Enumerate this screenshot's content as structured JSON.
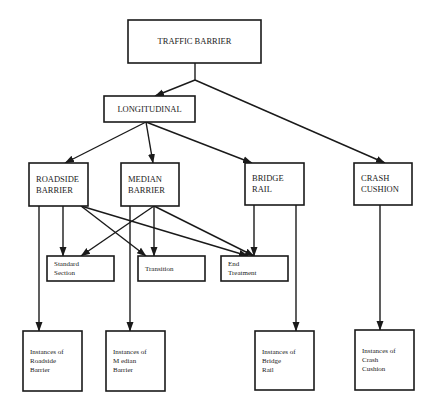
{
  "diagram": {
    "title": "TRAFFIC BARRIER",
    "nodes": [
      {
        "id": "traffic_barrier",
        "lines": [
          "TRAFFIC BARRIER"
        ],
        "x": 128,
        "y": 20,
        "w": 133,
        "h": 43,
        "font_size": 8.5,
        "align": "center"
      },
      {
        "id": "longitudinal",
        "lines": [
          "LONGITUDINAL"
        ],
        "x": 104,
        "y": 96,
        "w": 91,
        "h": 26,
        "font_size": 8.5,
        "align": "center"
      },
      {
        "id": "roadside_barrier",
        "lines": [
          "ROADSIDE",
          "BARRIER"
        ],
        "x": 29,
        "y": 163,
        "w": 59,
        "h": 43,
        "font_size": 8.5,
        "align": "left"
      },
      {
        "id": "median_barrier",
        "lines": [
          "MEDIAN",
          "BARRIER"
        ],
        "x": 121,
        "y": 163,
        "w": 58,
        "h": 43,
        "font_size": 8.5,
        "align": "left"
      },
      {
        "id": "bridge_rail",
        "lines": [
          "BRIDGE",
          "RAIL"
        ],
        "x": 245,
        "y": 163,
        "w": 59,
        "h": 42,
        "font_size": 8.5,
        "align": "left"
      },
      {
        "id": "crash_cushion",
        "lines": [
          "CRASH",
          "CUSHION"
        ],
        "x": 354,
        "y": 163,
        "w": 58,
        "h": 42,
        "font_size": 8.5,
        "align": "left"
      },
      {
        "id": "standard_section",
        "lines": [
          "Standard",
          "Section"
        ],
        "x": 47,
        "y": 256,
        "w": 67,
        "h": 25,
        "font_size": 7,
        "align": "left"
      },
      {
        "id": "transition",
        "lines": [
          "Transition"
        ],
        "x": 138,
        "y": 256,
        "w": 67,
        "h": 25,
        "font_size": 7,
        "align": "left"
      },
      {
        "id": "end_treatment",
        "lines": [
          "End",
          "Treatment"
        ],
        "x": 221,
        "y": 256,
        "w": 67,
        "h": 25,
        "font_size": 7,
        "align": "left"
      },
      {
        "id": "instances_roadside",
        "lines": [
          "Instances of",
          "Roadside",
          "Barrier"
        ],
        "x": 23,
        "y": 331,
        "w": 59,
        "h": 60,
        "font_size": 7,
        "align": "left"
      },
      {
        "id": "instances_median",
        "lines": [
          "Instances of",
          "M edian",
          "Barrier"
        ],
        "x": 106,
        "y": 331,
        "w": 59,
        "h": 60,
        "font_size": 7,
        "align": "left"
      },
      {
        "id": "instances_bridge",
        "lines": [
          "Instances of",
          "Bridge",
          "Rail"
        ],
        "x": 255,
        "y": 331,
        "w": 59,
        "h": 59,
        "font_size": 7,
        "align": "left"
      },
      {
        "id": "instances_crash",
        "lines": [
          "Instances of",
          "Crash",
          "Cushion"
        ],
        "x": 355,
        "y": 330,
        "w": 59,
        "h": 60,
        "font_size": 7,
        "align": "left"
      }
    ],
    "edges": [
      {
        "from": "traffic_barrier",
        "to": "junction",
        "points": [
          [
            195,
            63
          ],
          [
            195,
            80
          ]
        ],
        "arrow": false
      },
      {
        "from": "junction",
        "to": "longitudinal",
        "points": [
          [
            195,
            80
          ],
          [
            155,
            96
          ]
        ],
        "arrow": true
      },
      {
        "from": "junction",
        "to": "crash_cushion",
        "points": [
          [
            195,
            80
          ],
          [
            385,
            163
          ]
        ],
        "arrow": true
      },
      {
        "from": "longitudinal",
        "to": "roadside_barrier",
        "points": [
          [
            146,
            122
          ],
          [
            65,
            163
          ]
        ],
        "arrow": true
      },
      {
        "from": "longitudinal",
        "to": "median_barrier",
        "points": [
          [
            146,
            122
          ],
          [
            153,
            163
          ]
        ],
        "arrow": true
      },
      {
        "from": "longitudinal",
        "to": "bridge_rail",
        "points": [
          [
            146,
            122
          ],
          [
            252,
            163
          ]
        ],
        "arrow": true
      },
      {
        "from": "roadside_barrier",
        "to": "standard_section",
        "points": [
          [
            63,
            206
          ],
          [
            63,
            256
          ]
        ],
        "arrow": true
      },
      {
        "from": "roadside_barrier",
        "to": "transition",
        "points": [
          [
            81,
            206
          ],
          [
            146,
            256
          ]
        ],
        "arrow": true
      },
      {
        "from": "roadside_barrier",
        "to": "end_treatment",
        "points": [
          [
            81,
            206
          ],
          [
            248,
            256
          ]
        ],
        "arrow": true
      },
      {
        "from": "median_barrier",
        "to": "standard_section",
        "points": [
          [
            154,
            206
          ],
          [
            81,
            256
          ]
        ],
        "arrow": true
      },
      {
        "from": "median_barrier",
        "to": "transition",
        "points": [
          [
            154,
            206
          ],
          [
            154,
            256
          ]
        ],
        "arrow": true
      },
      {
        "from": "median_barrier",
        "to": "end_treatment",
        "points": [
          [
            154,
            206
          ],
          [
            254,
            256
          ]
        ],
        "arrow": true
      },
      {
        "from": "bridge_rail",
        "to": "end_treatment",
        "points": [
          [
            254,
            205
          ],
          [
            254,
            256
          ]
        ],
        "arrow": true
      },
      {
        "from": "roadside_barrier",
        "to": "instances_roadside",
        "points": [
          [
            39,
            206
          ],
          [
            39,
            331
          ]
        ],
        "arrow": true
      },
      {
        "from": "median_barrier",
        "to": "instances_median",
        "points": [
          [
            130,
            206
          ],
          [
            130,
            331
          ]
        ],
        "arrow": true
      },
      {
        "from": "bridge_rail",
        "to": "instances_bridge",
        "points": [
          [
            296,
            205
          ],
          [
            296,
            331
          ]
        ],
        "arrow": true
      },
      {
        "from": "crash_cushion",
        "to": "instances_crash",
        "points": [
          [
            380,
            205
          ],
          [
            380,
            330
          ]
        ],
        "arrow": true
      }
    ]
  },
  "colors": {
    "stroke": "#1a1a1a",
    "text": "#222222",
    "background": "#ffffff"
  }
}
